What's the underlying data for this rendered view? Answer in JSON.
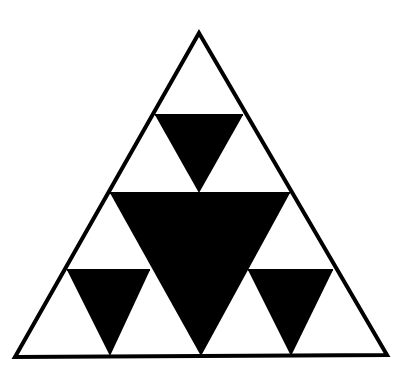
{
  "figure": {
    "background": "#ffffff",
    "stroke_color": "#000000",
    "fill_color": "#000000",
    "outer_triangle": {
      "points": "199,33 15,357 387,355",
      "stroke_width": 4
    },
    "black_triangles": [
      {
        "id": "center-large",
        "points": "110,193 290,193 201,356"
      },
      {
        "id": "top-small",
        "points": "155,115 243,115 199,193"
      },
      {
        "id": "left-small",
        "points": "67,270 150,270 110,356"
      },
      {
        "id": "right-small",
        "points": "248,270 333,270 291,356"
      }
    ],
    "outline_lines": [
      {
        "id": "top-row-line",
        "points": "155,115 243,115"
      },
      {
        "id": "mid-line",
        "points": "110,193 290,193"
      },
      {
        "id": "low-left-line",
        "points": "67,270 150,270"
      },
      {
        "id": "low-right-line",
        "points": "248,270 333,270"
      }
    ]
  }
}
